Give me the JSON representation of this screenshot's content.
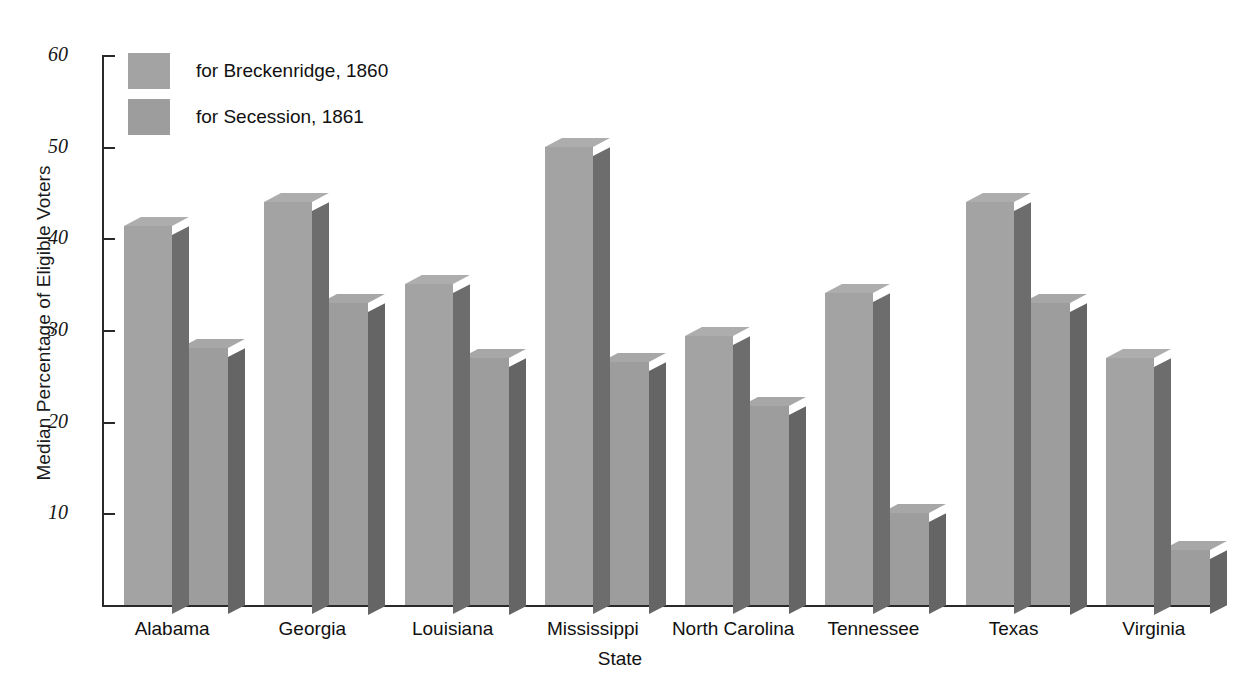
{
  "chart_data": {
    "type": "bar",
    "title": "",
    "subtitle": "",
    "xlabel": "State",
    "ylabel": "Median Percentage of Eligible Voters",
    "categories": [
      "Alabama",
      "Georgia",
      "Louisiana",
      "Mississippi",
      "North Carolina",
      "Tennessee",
      "Texas",
      "Virginia"
    ],
    "series": [
      {
        "name": "for Breckenridge, 1860",
        "color": "#a3a3a3",
        "values": [
          41.3,
          44,
          35,
          50,
          29.3,
          34,
          44,
          27
        ]
      },
      {
        "name": "for Secession, 1861",
        "color": "#9d9d9d",
        "values": [
          28,
          33,
          27,
          26.5,
          21.7,
          10,
          33,
          6
        ]
      }
    ],
    "ylim": [
      0,
      60
    ],
    "yticks": [
      10,
      20,
      30,
      40,
      50,
      60
    ],
    "ytick_labels": [
      "10",
      "20",
      "30",
      "40",
      "50",
      "60"
    ],
    "grid": false,
    "legend_position": "top-left",
    "style": "3d-bar"
  },
  "legend": {
    "items": [
      {
        "label": "for Breckenridge, 1860",
        "swatch": "#a3a3a3"
      },
      {
        "label": "for Secession, 1861",
        "swatch": "#9d9d9d"
      }
    ]
  },
  "axes": {
    "y_title": "Median Percentage of Eligible Voters",
    "x_title": "State"
  }
}
